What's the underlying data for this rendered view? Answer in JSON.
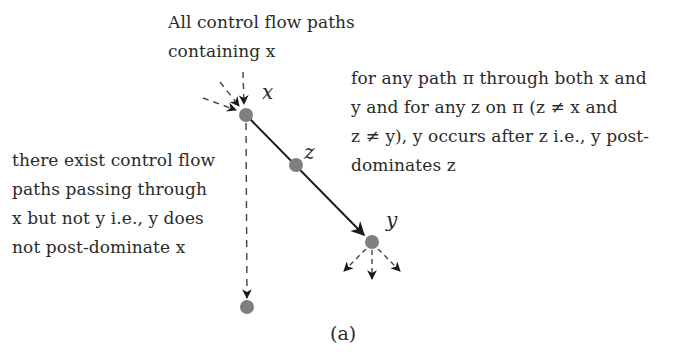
{
  "diagram": {
    "caption": "(a)",
    "annotations": {
      "top": [
        "All control flow paths",
        "containing x"
      ],
      "right": [
        "for any path π through both x and",
        "y and for any z on π (z ≠ x and",
        "z ≠ y), y occurs after z i.e., y post-",
        "dominates z"
      ],
      "left": [
        "there exist control flow",
        "paths passing through",
        "x but not y i.e., y does",
        "not post-dominate x"
      ]
    },
    "nodes": [
      {
        "id": "x",
        "label": "x",
        "cx": 246,
        "cy": 115
      },
      {
        "id": "z",
        "label": "z",
        "cx": 296,
        "cy": 165
      },
      {
        "id": "y",
        "label": "y",
        "cx": 372,
        "cy": 242
      },
      {
        "id": "w",
        "label": "",
        "cx": 247,
        "cy": 307
      }
    ],
    "edges": [
      {
        "from": "x",
        "to": "y",
        "style": "solid",
        "via": "z"
      },
      {
        "from": "x",
        "to": "w",
        "style": "dashed"
      }
    ],
    "node_color": "#7f7f7f",
    "edge_color": "#1a1a1a"
  }
}
